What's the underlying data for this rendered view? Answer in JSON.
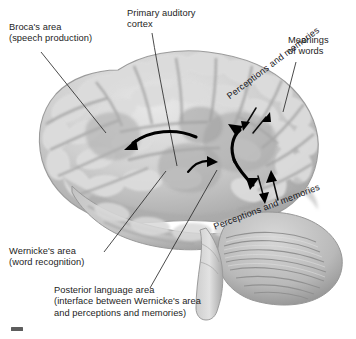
{
  "figure": {
    "background_color": "#ffffff",
    "text_color": "#1d1d1d",
    "arrow_color": "#000000",
    "leader_color": "#2a2a2a"
  },
  "labels": {
    "brocas": {
      "line1": "Broca's area",
      "line2": "(speech production)"
    },
    "auditory": {
      "line1": "Primary auditory",
      "line2": "cortex"
    },
    "meanings": {
      "line1": "Meanings",
      "line2": "of words"
    },
    "perceptions_upper": "Perceptions and memories",
    "perceptions_lower": "Perceptions and memories",
    "wernickes": {
      "line1": "Wernicke's area",
      "line2": "(word recognition)"
    },
    "posterior": {
      "line1": "Posterior language area",
      "line2": "(interface between Wernicke's area",
      "line3": "and perceptions and memories)"
    }
  },
  "brain": {
    "region_names": [
      "frontal-lobe",
      "temporal-lobe",
      "parietal-lobe",
      "occipital-lobe",
      "cerebellum",
      "brainstem"
    ],
    "base_color": "#c9c9c9",
    "highlight_color": "#e4e4e4",
    "shadow_color": "#8e8e8e"
  },
  "arrows": {
    "brocas_flow": "curved-arrow-to-brocas",
    "wernickes_flow": "curved-arrow-to-wernickes",
    "s_curve_upper": "s-curve-arrow-up",
    "s_curve_lower": "s-curve-arrow-down",
    "meanings_in": "arrow-down-left",
    "meanings_out": "arrow-up-right",
    "percept_in": "arrow-down",
    "percept_out": "arrow-up"
  }
}
